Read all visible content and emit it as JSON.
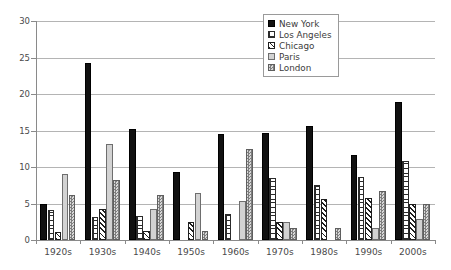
{
  "chart_data": {
    "type": "bar",
    "title": "",
    "xlabel": "",
    "ylabel": "",
    "ylim": [
      0,
      30
    ],
    "yticks": [
      0,
      5,
      10,
      15,
      20,
      25,
      30
    ],
    "grid": true,
    "legend_position": "top-right",
    "categories": [
      "1920s",
      "1930s",
      "1940s",
      "1950s",
      "1960s",
      "1970s",
      "1980s",
      "1990s",
      "2000s"
    ],
    "series": [
      {
        "name": "New York",
        "pattern": "solid-black",
        "color": "#111111",
        "values": [
          5.0,
          24.2,
          15.2,
          9.3,
          14.5,
          14.6,
          15.6,
          11.7,
          18.9
        ]
      },
      {
        "name": "Los Angeles",
        "pattern": "grid-crosshatch",
        "color": "#2b2b2b",
        "values": [
          4.1,
          3.2,
          3.3,
          0,
          3.5,
          8.5,
          7.6,
          8.7,
          10.8
        ]
      },
      {
        "name": "Chicago",
        "pattern": "diagonal-hatch",
        "color": "#1f1f1f",
        "values": [
          1.1,
          4.2,
          1.3,
          2.4,
          0,
          2.5,
          5.6,
          5.7,
          4.9
        ]
      },
      {
        "name": "Paris",
        "pattern": "light-gray-solid",
        "color": "#d2d2d2",
        "values": [
          9.1,
          13.2,
          4.3,
          6.4,
          5.4,
          2.5,
          0,
          1.7,
          2.9
        ]
      },
      {
        "name": "London",
        "pattern": "checkerboard-gray",
        "color": "#7e7e7e",
        "values": [
          6.1,
          8.2,
          6.2,
          1.3,
          12.5,
          1.6,
          1.7,
          6.7,
          4.9
        ]
      }
    ]
  }
}
